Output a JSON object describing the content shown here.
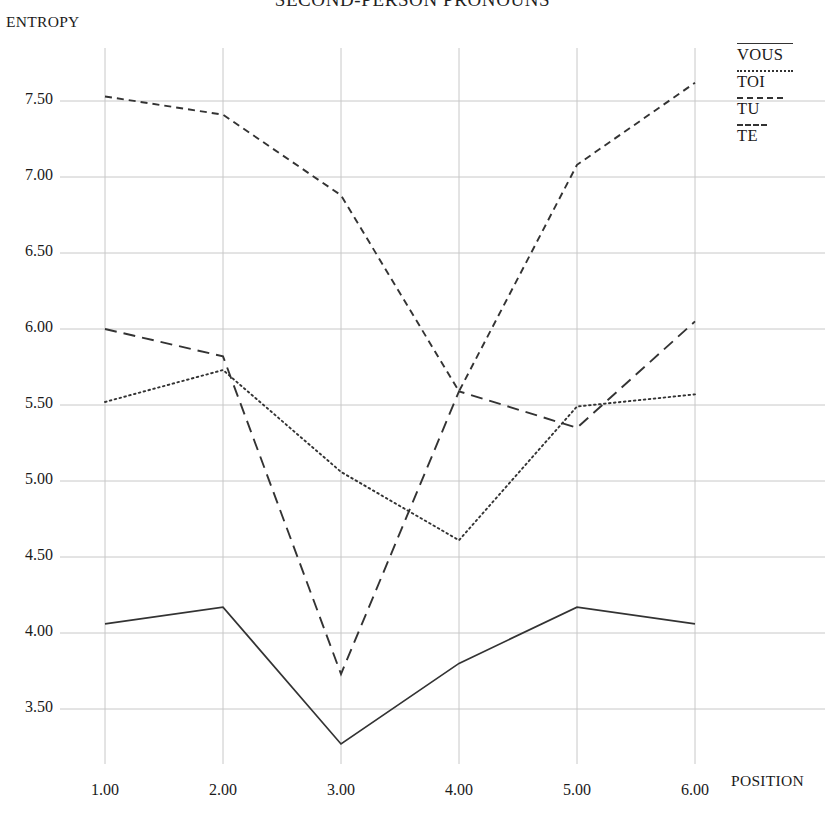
{
  "chart_data": {
    "type": "line",
    "title": "SECOND-PERSON PRONOUNS",
    "xlabel": "POSITION",
    "ylabel": "ENTROPY",
    "x": [
      1,
      2,
      3,
      4,
      5,
      6
    ],
    "xtick_labels": [
      "1.00",
      "2.00",
      "3.00",
      "4.00",
      "5.00",
      "6.00"
    ],
    "ytick_labels": [
      "7.50",
      "7.00",
      "6.50",
      "6.00",
      "5.50",
      "5.00",
      "4.50",
      "4.00",
      "3.50"
    ],
    "yticks": [
      7.5,
      7.0,
      6.5,
      6.0,
      5.5,
      5.0,
      4.5,
      4.0,
      3.5
    ],
    "xlim": [
      1,
      6
    ],
    "ylim": [
      3.2,
      7.75
    ],
    "grid": true,
    "legend_position": "top-right",
    "series": [
      {
        "name": "VOUS",
        "style": "solid",
        "values": [
          4.06,
          4.17,
          3.27,
          3.8,
          4.17,
          4.06
        ]
      },
      {
        "name": "TOI",
        "style": "dotted",
        "values": [
          5.52,
          5.73,
          5.06,
          4.61,
          5.49,
          5.57
        ]
      },
      {
        "name": "TU",
        "style": "dashed-short",
        "values": [
          7.53,
          7.41,
          6.88,
          5.59,
          7.08,
          7.62
        ]
      },
      {
        "name": "TE",
        "style": "dashed-long",
        "values": [
          6.0,
          5.82,
          3.73,
          5.59,
          5.35,
          6.05
        ]
      }
    ]
  },
  "colors": {
    "line": "#333333",
    "grid": "#c8c8c8",
    "text": "#1a1a1a",
    "background": "#ffffff"
  }
}
